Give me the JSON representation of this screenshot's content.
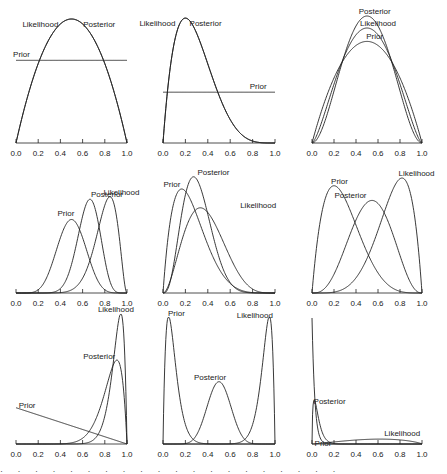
{
  "chart_data": {
    "type": "line",
    "layout": {
      "rows": 3,
      "cols": 3,
      "grid": false,
      "legend": "inline curve labels"
    },
    "xlim": [
      0,
      1
    ],
    "xticks": [
      "0.0",
      "0.2",
      "0.4",
      "0.6",
      "0.8",
      "1.0"
    ],
    "panels": [
      {
        "id": "r1c1",
        "series": [
          {
            "name": "Likelihood",
            "dist": "beta",
            "a": 2,
            "b": 2,
            "label_x": 0.22,
            "label_y_px": 8
          },
          {
            "name": "Posterior",
            "dist": "beta",
            "a": 2,
            "b": 2,
            "label_x": 0.75,
            "label_y_px": 8
          },
          {
            "name": "Prior",
            "dist": "uniform",
            "a": 1,
            "b": 1,
            "label_x": 0.05,
            "label_y_px": -3
          }
        ],
        "peak_px": 124,
        "ymax_scale": 1.5
      },
      {
        "id": "r1c2",
        "series": [
          {
            "name": "Likelihood",
            "dist": "beta",
            "a": 2,
            "b": 5,
            "label_x": -0.05,
            "label_y_px": 8
          },
          {
            "name": "Posterior",
            "dist": "beta",
            "a": 2,
            "b": 5,
            "label_x": 0.38,
            "label_y_px": 8
          },
          {
            "name": "Prior",
            "dist": "uniform",
            "a": 1,
            "b": 1,
            "label_x": 0.85,
            "label_y_px": -3
          }
        ],
        "peak_px": 125,
        "ymax_scale": 2.46
      },
      {
        "id": "r1c3",
        "series": [
          {
            "name": "Posterior",
            "dist": "beta",
            "a": 3,
            "b": 3,
            "label_x": 0.57,
            "label_y_px": -2
          },
          {
            "name": "Likelihood",
            "dist": "beta",
            "a": 2.5,
            "b": 2.5,
            "label_x": 0.6,
            "label_y_px": -2
          },
          {
            "name": "Prior",
            "dist": "beta",
            "a": 2,
            "b": 2,
            "label_x": 0.57,
            "label_y_px": -2
          }
        ],
        "peak_px": 127,
        "ymax_scale": 1.875
      },
      {
        "id": "r2c1",
        "series": [
          {
            "name": "Prior",
            "dist": "beta",
            "a": 8,
            "b": 8,
            "label_x": 0.45,
            "label_y_px": -3
          },
          {
            "name": "Posterior",
            "dist": "beta",
            "a": 15,
            "b": 8,
            "label_x": 0.82,
            "label_y_px": -2
          },
          {
            "name": "Likelihood",
            "dist": "beta",
            "a": 12,
            "b": 3,
            "label_x": 0.95,
            "label_y_px": -2
          }
        ],
        "peak_px": 124,
        "ymax_scale": 5.3
      },
      {
        "id": "r2c2",
        "series": [
          {
            "name": "Prior",
            "dist": "beta",
            "a": 2,
            "b": 6,
            "label_x": 0.08,
            "label_y_px": -2
          },
          {
            "name": "Posterior",
            "dist": "beta",
            "a": 4,
            "b": 9,
            "label_x": 0.45,
            "label_y_px": -2
          },
          {
            "name": "Likelihood",
            "dist": "beta",
            "a": 3,
            "b": 5,
            "label_x": 0.85,
            "label_y_px": 0
          }
        ],
        "peak_px": 122,
        "ymax_scale": 3.3
      },
      {
        "id": "r2c3",
        "series": [
          {
            "name": "Prior",
            "dist": "beta",
            "a": 2,
            "b": 5,
            "label_x": 0.25,
            "label_y_px": -2
          },
          {
            "name": "Posterior",
            "dist": "beta",
            "a": 4,
            "b": 3.5,
            "label_x": 0.35,
            "label_y_px": -2
          },
          {
            "name": "Likelihood",
            "dist": "beta",
            "a": 5.5,
            "b": 2,
            "label_x": 0.95,
            "label_y_px": -2
          }
        ],
        "peak_px": 120,
        "ymax_scale": 2.75
      },
      {
        "id": "r3c1",
        "series": [
          {
            "name": "Prior",
            "dist": "linear",
            "y0": 2,
            "y1": 0,
            "label_x": 0.1,
            "label_y_px": -3
          },
          {
            "name": "Posterior",
            "dist": "beta",
            "a": 11,
            "b": 2,
            "label_x": 0.75,
            "label_y_px": -1
          },
          {
            "name": "Likelihood",
            "dist": "beta",
            "a": 18,
            "b": 2,
            "label_x": 0.9,
            "label_y_px": -2
          }
        ],
        "peak_px": 127,
        "ymax_scale": 7.0
      },
      {
        "id": "r3c2",
        "series": [
          {
            "name": "Prior",
            "dist": "beta",
            "a": 2,
            "b": 20,
            "label_x": 0.12,
            "label_y_px": -2
          },
          {
            "name": "Posterior",
            "dist": "beta",
            "a": 12,
            "b": 12,
            "label_x": 0.42,
            "label_y_px": -2
          },
          {
            "name": "Likelihood",
            "dist": "beta",
            "a": 20,
            "b": 2,
            "label_x": 0.82,
            "label_y_px": 0
          }
        ],
        "peak_px": 124,
        "ymax_scale": 7.7
      },
      {
        "id": "r3c3",
        "series": [
          {
            "name": "Prior",
            "dist": "beta",
            "a": 1,
            "b": 40,
            "label_x": 0.1,
            "label_y_px": 4
          },
          {
            "name": "Posterior",
            "dist": "beta",
            "a": 1.6,
            "b": 30,
            "label_x": 0.16,
            "label_y_px": 4
          },
          {
            "name": "Likelihood",
            "dist": "beta",
            "a": 2.3,
            "b": 1.8,
            "label_x": 0.82,
            "label_y_px": -3
          }
        ],
        "peak_px": 126,
        "ymax_scale": 40
      }
    ]
  },
  "caption_fragment": "· · · · · · · · · · · · · · · · · · · ·"
}
